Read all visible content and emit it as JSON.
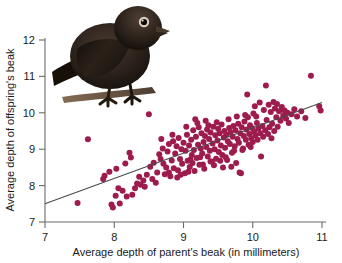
{
  "figure": {
    "name": "darwin-finch-beak-heritability-scatterplot",
    "background": "#ffffff"
  },
  "photo": {
    "alt_label": "Darwin's finch perched on a branch",
    "plumage_color": "#2b211c",
    "beak_color": "#3a2f26",
    "branch_color": "#6b5540"
  },
  "axes": {
    "x": {
      "label": "Average depth of parent's beak (in millimeters)",
      "min": 7,
      "max": 11,
      "ticks": [
        7,
        8,
        9,
        10,
        11
      ],
      "tick_labels": [
        "7",
        "8",
        "9",
        "10",
        "11"
      ]
    },
    "y": {
      "label": "Average depth of offspring's beak",
      "min": 7,
      "max": 12,
      "ticks": [
        7,
        8,
        9,
        10,
        11,
        12
      ],
      "tick_labels": [
        "7",
        "8",
        "9",
        "10",
        "11",
        "12"
      ]
    },
    "axis_color": "#6b6b6b"
  },
  "chart_data": {
    "type": "scatter",
    "title": "",
    "xlabel": "Average depth of parent's beak (in millimeters)",
    "ylabel": "Average depth of offspring's beak",
    "xlim": [
      7,
      11
    ],
    "ylim": [
      7,
      12
    ],
    "grid": false,
    "legend": "none",
    "marker_color": "#9e1b4e",
    "marker_radius_px": 3.0,
    "trend_line": {
      "color": "#4a4a4a",
      "x_start": 7.0,
      "y_start": 7.5,
      "x_end": 11.0,
      "y_end": 10.28,
      "slope": 0.695,
      "intercept": 2.635
    },
    "points": [
      [
        7.47,
        7.52
      ],
      [
        7.62,
        9.27
      ],
      [
        7.84,
        8.18
      ],
      [
        7.86,
        8.27
      ],
      [
        7.93,
        8.38
      ],
      [
        7.96,
        7.48
      ],
      [
        7.98,
        7.4
      ],
      [
        8.02,
        7.72
      ],
      [
        8.03,
        8.46
      ],
      [
        8.06,
        7.93
      ],
      [
        8.08,
        7.51
      ],
      [
        8.12,
        7.86
      ],
      [
        8.16,
        8.61
      ],
      [
        8.18,
        7.7
      ],
      [
        8.22,
        8.9
      ],
      [
        8.24,
        8.77
      ],
      [
        8.26,
        7.75
      ],
      [
        8.3,
        7.93
      ],
      [
        8.33,
        8.06
      ],
      [
        8.36,
        8.24
      ],
      [
        8.38,
        8.02
      ],
      [
        8.42,
        8.14
      ],
      [
        8.44,
        7.97
      ],
      [
        8.47,
        8.3
      ],
      [
        8.5,
        9.96
      ],
      [
        8.52,
        8.52
      ],
      [
        8.55,
        8.18
      ],
      [
        8.57,
        8.63
      ],
      [
        8.6,
        8.08
      ],
      [
        8.62,
        8.36
      ],
      [
        8.65,
        8.86
      ],
      [
        8.67,
        8.73
      ],
      [
        8.7,
        9.02
      ],
      [
        8.71,
        8.6
      ],
      [
        8.73,
        8.31
      ],
      [
        8.75,
        8.5
      ],
      [
        8.77,
        8.94
      ],
      [
        8.79,
        9.14
      ],
      [
        8.81,
        8.26
      ],
      [
        8.83,
        8.69
      ],
      [
        8.85,
        9.22
      ],
      [
        8.86,
        8.48
      ],
      [
        8.88,
        8.88
      ],
      [
        8.9,
        9.08
      ],
      [
        8.92,
        8.42
      ],
      [
        8.93,
        9.31
      ],
      [
        8.95,
        8.73
      ],
      [
        8.97,
        9.0
      ],
      [
        8.98,
        8.6
      ],
      [
        9.0,
        9.18
      ],
      [
        9.02,
        8.34
      ],
      [
        9.03,
        8.96
      ],
      [
        9.05,
        9.4
      ],
      [
        9.06,
        8.68
      ],
      [
        9.08,
        9.1
      ],
      [
        9.09,
        8.51
      ],
      [
        9.11,
        9.26
      ],
      [
        9.12,
        8.84
      ],
      [
        9.14,
        9.52
      ],
      [
        9.15,
        8.98
      ],
      [
        9.16,
        8.4
      ],
      [
        9.18,
        9.34
      ],
      [
        9.19,
        8.76
      ],
      [
        9.21,
        9.12
      ],
      [
        9.22,
        9.6
      ],
      [
        9.23,
        8.57
      ],
      [
        9.25,
        9.02
      ],
      [
        9.26,
        9.44
      ],
      [
        9.27,
        8.88
      ],
      [
        9.29,
        9.2
      ],
      [
        9.3,
        8.46
      ],
      [
        9.31,
        9.36
      ],
      [
        9.33,
        9.06
      ],
      [
        9.34,
        9.54
      ],
      [
        9.35,
        8.8
      ],
      [
        9.37,
        9.28
      ],
      [
        9.38,
        8.96
      ],
      [
        9.39,
        9.46
      ],
      [
        9.41,
        8.66
      ],
      [
        9.42,
        9.16
      ],
      [
        9.43,
        9.62
      ],
      [
        9.45,
        9.0
      ],
      [
        9.46,
        9.38
      ],
      [
        9.47,
        8.74
      ],
      [
        9.49,
        9.24
      ],
      [
        9.5,
        9.56
      ],
      [
        9.51,
        8.92
      ],
      [
        9.52,
        9.44
      ],
      [
        9.54,
        9.1
      ],
      [
        9.55,
        9.68
      ],
      [
        9.56,
        8.84
      ],
      [
        9.58,
        9.32
      ],
      [
        9.59,
        9.5
      ],
      [
        9.6,
        9.04
      ],
      [
        9.62,
        9.4
      ],
      [
        9.63,
        8.7
      ],
      [
        9.64,
        9.22
      ],
      [
        9.66,
        9.58
      ],
      [
        9.67,
        9.14
      ],
      [
        9.68,
        9.46
      ],
      [
        9.7,
        8.9
      ],
      [
        9.71,
        9.34
      ],
      [
        9.72,
        9.64
      ],
      [
        9.74,
        9.08
      ],
      [
        9.75,
        9.52
      ],
      [
        9.76,
        8.62
      ],
      [
        9.78,
        9.28
      ],
      [
        9.79,
        9.7
      ],
      [
        9.8,
        9.18
      ],
      [
        9.82,
        9.44
      ],
      [
        9.83,
        8.34
      ],
      [
        9.84,
        9.6
      ],
      [
        9.86,
        9.02
      ],
      [
        9.87,
        9.36
      ],
      [
        9.88,
        9.76
      ],
      [
        9.9,
        9.26
      ],
      [
        9.91,
        9.54
      ],
      [
        9.92,
        10.5
      ],
      [
        9.94,
        9.12
      ],
      [
        9.95,
        9.42
      ],
      [
        9.96,
        9.66
      ],
      [
        9.98,
        9.3
      ],
      [
        9.99,
        9.58
      ],
      [
        10.0,
        9.2
      ],
      [
        10.02,
        9.48
      ],
      [
        10.03,
        10.18
      ],
      [
        10.04,
        9.38
      ],
      [
        10.06,
        9.72
      ],
      [
        10.07,
        9.26
      ],
      [
        10.08,
        9.56
      ],
      [
        10.1,
        10.28
      ],
      [
        10.11,
        9.44
      ],
      [
        10.12,
        8.8
      ],
      [
        10.14,
        9.64
      ],
      [
        10.15,
        9.34
      ],
      [
        10.16,
        10.08
      ],
      [
        10.18,
        9.52
      ],
      [
        10.19,
        10.75
      ],
      [
        10.2,
        9.8
      ],
      [
        10.22,
        9.42
      ],
      [
        10.23,
        10.22
      ],
      [
        10.24,
        9.6
      ],
      [
        10.26,
        10.02
      ],
      [
        10.27,
        9.3
      ],
      [
        10.28,
        9.7
      ],
      [
        10.3,
        10.3
      ],
      [
        10.31,
        9.5
      ],
      [
        10.32,
        10.12
      ],
      [
        10.34,
        9.88
      ],
      [
        10.35,
        10.24
      ],
      [
        10.36,
        9.62
      ],
      [
        10.38,
        10.04
      ],
      [
        10.4,
        9.78
      ],
      [
        10.42,
        10.16
      ],
      [
        10.44,
        9.92
      ],
      [
        10.46,
        10.06
      ],
      [
        10.48,
        9.84
      ],
      [
        10.5,
        10.0
      ],
      [
        10.52,
        9.72
      ],
      [
        10.56,
        9.96
      ],
      [
        10.6,
        10.1
      ],
      [
        10.64,
        9.9
      ],
      [
        10.7,
        10.04
      ],
      [
        10.76,
        9.86
      ],
      [
        10.84,
        11.02
      ],
      [
        10.96,
        10.18
      ],
      [
        10.98,
        10.06
      ],
      [
        9.13,
        8.62
      ],
      [
        9.28,
        8.58
      ],
      [
        9.44,
        8.56
      ],
      [
        9.57,
        8.5
      ],
      [
        9.69,
        8.52
      ],
      [
        9.81,
        8.36
      ],
      [
        8.96,
        8.3
      ],
      [
        9.07,
        8.38
      ],
      [
        8.68,
        9.28
      ],
      [
        8.84,
        9.4
      ],
      [
        9.04,
        9.62
      ],
      [
        9.2,
        9.72
      ],
      [
        9.36,
        9.66
      ],
      [
        9.48,
        9.74
      ],
      [
        9.65,
        9.82
      ],
      [
        9.77,
        9.9
      ],
      [
        9.89,
        9.94
      ],
      [
        10.01,
        9.98
      ],
      [
        9.1,
        8.72
      ],
      [
        9.24,
        8.78
      ],
      [
        9.39,
        8.66
      ],
      [
        9.53,
        8.68
      ],
      [
        9.61,
        8.78
      ],
      [
        9.73,
        8.96
      ],
      [
        9.85,
        8.98
      ],
      [
        9.97,
        9.06
      ],
      [
        8.79,
        8.36
      ],
      [
        8.91,
        8.22
      ],
      [
        9.17,
        9.82
      ],
      [
        9.32,
        9.78
      ],
      [
        9.93,
        9.88
      ],
      [
        10.05,
        9.9
      ]
    ]
  }
}
